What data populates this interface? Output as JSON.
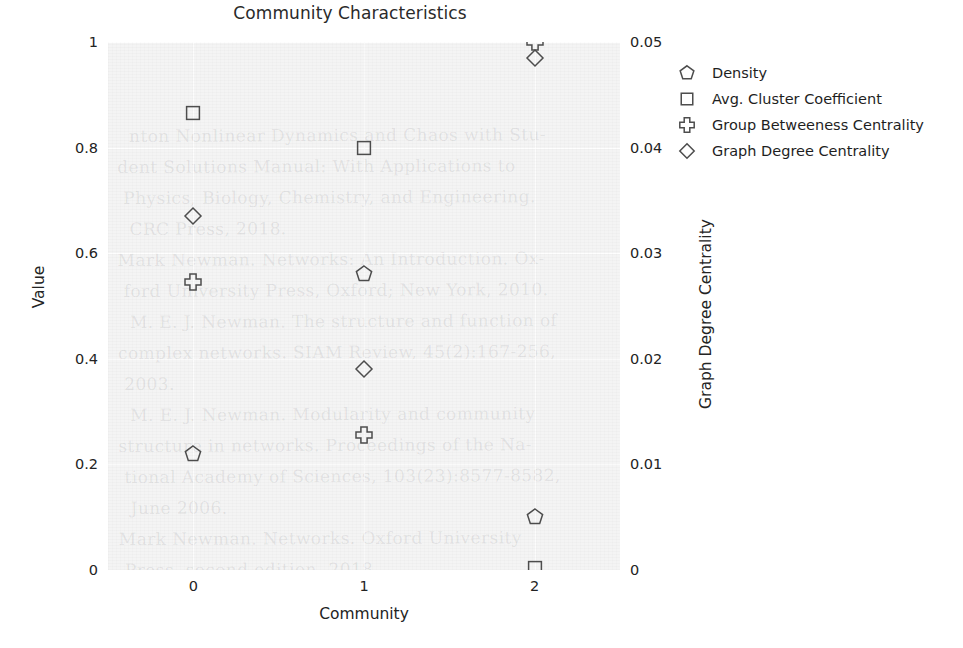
{
  "chart_data": {
    "type": "scatter",
    "title": "Community Characteristics",
    "xlabel": "Community",
    "ylabel": "Value",
    "ylabel_right": "Graph Degree Centrality",
    "x": [
      0,
      1,
      2
    ],
    "xtick_labels": [
      "0",
      "1",
      "2"
    ],
    "xlim": [
      -0.5,
      2.5
    ],
    "ylim": [
      0,
      1
    ],
    "ytick_labels": [
      "0",
      "0.2",
      "0.4",
      "0.6",
      "0.8",
      "1"
    ],
    "ytick_values": [
      0,
      0.2,
      0.4,
      0.6,
      0.8,
      1
    ],
    "ylim_right": [
      0,
      0.05
    ],
    "ytick_labels_right": [
      "0",
      "0.01",
      "0.02",
      "0.03",
      "0.04",
      "0.05"
    ],
    "ytick_values_right": [
      0,
      0.01,
      0.02,
      0.03,
      0.04,
      0.05
    ],
    "grid": true,
    "legend_position": "right",
    "marker_color": "#4d4d4d",
    "plot_bg": "#f4f4f4",
    "series": [
      {
        "name": "Density",
        "marker": "pentagon",
        "axis": "left",
        "values": [
          0.22,
          0.56,
          0.1
        ]
      },
      {
        "name": "Avg. Cluster Coefficient",
        "marker": "square",
        "axis": "left",
        "values": [
          0.865,
          0.8,
          0.003
        ]
      },
      {
        "name": "Group Betweeness Centrality",
        "marker": "plus",
        "axis": "left",
        "values": [
          0.545,
          0.255,
          1.0
        ]
      },
      {
        "name": "Graph Degree Centrality",
        "marker": "diamond",
        "axis": "right",
        "values": [
          0.0335,
          0.019,
          0.0485
        ]
      }
    ]
  },
  "legend": {
    "entries": [
      {
        "label": "Density",
        "marker": "pentagon"
      },
      {
        "label": "Avg. Cluster Coefficient",
        "marker": "square"
      },
      {
        "label": "Group Betweeness Centrality",
        "marker": "plus"
      },
      {
        "label": "Graph Degree Centrality",
        "marker": "diamond"
      }
    ]
  },
  "background_ghost_text": [
    "nton  Nonlinear  Dynamics  and  Chaos  with  Stu-",
    "dent  Solutions  Manual:  With  Applications  to",
    "Physics,  Biology,  Chemistry,  and  Engineering.",
    "CRC  Press,  2018.",
    "Mark  Newman.  Networks:  An  Introduction.  Ox-",
    "ford  University  Press,  Oxford;  New  York,  2010.",
    "M.  E.  J.  Newman.  The  structure  and  function  of",
    "complex  networks.  SIAM  Review,  45(2):167-256,",
    "2003.",
    "M.  E.  J.  Newman.  Modularity  and  community",
    "structure  in  networks.  Proceedings  of  the  Na-",
    "tional  Academy  of  Sciences,  103(23):8577-8582,",
    "June  2006.",
    "Mark  Newman.  Networks.  Oxford  University",
    "Press,  second  edition,  2018."
  ]
}
